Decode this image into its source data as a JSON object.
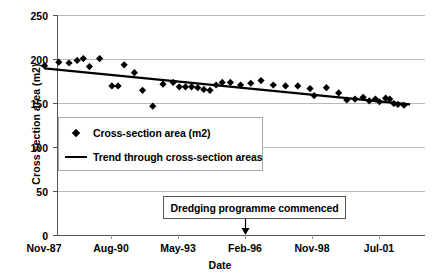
{
  "chart_data": {
    "type": "scatter",
    "title": "",
    "xlabel": "Date",
    "ylabel": "Cross section area (m2)",
    "ylim": [
      0,
      250
    ],
    "yticks": [
      0,
      50,
      100,
      150,
      200,
      250
    ],
    "xticks": [
      "Nov-87",
      "Aug-90",
      "May-93",
      "Feb-96",
      "Nov-98",
      "Jul-01"
    ],
    "grid": true,
    "legend_position": "inside-left",
    "legend": [
      {
        "label": "Cross-section area (m2)",
        "marker": "diamond"
      },
      {
        "label": "Trend through cross-section areas",
        "marker": "line"
      }
    ],
    "annotations": [
      {
        "text": "Dredging programme commenced",
        "points_to_x": "Feb-96"
      }
    ],
    "series": [
      {
        "name": "Cross-section area (m2)",
        "marker": "diamond",
        "color": "#000000",
        "points": [
          {
            "x": "Nov-87",
            "y": 193
          },
          {
            "x": "Jun-88",
            "y": 197
          },
          {
            "x": "Nov-88",
            "y": 196
          },
          {
            "x": "Mar-89",
            "y": 199
          },
          {
            "x": "Jun-89",
            "y": 201
          },
          {
            "x": "Sep-89",
            "y": 192
          },
          {
            "x": "Feb-90",
            "y": 201
          },
          {
            "x": "Aug-90",
            "y": 170
          },
          {
            "x": "Nov-90",
            "y": 170
          },
          {
            "x": "Feb-91",
            "y": 194
          },
          {
            "x": "Jul-91",
            "y": 185
          },
          {
            "x": "Nov-91",
            "y": 165
          },
          {
            "x": "Apr-92",
            "y": 147
          },
          {
            "x": "Sep-92",
            "y": 172
          },
          {
            "x": "Feb-93",
            "y": 174
          },
          {
            "x": "May-93",
            "y": 169
          },
          {
            "x": "Aug-93",
            "y": 169
          },
          {
            "x": "Nov-93",
            "y": 169
          },
          {
            "x": "Feb-94",
            "y": 168
          },
          {
            "x": "May-94",
            "y": 166
          },
          {
            "x": "Aug-94",
            "y": 165
          },
          {
            "x": "Nov-94",
            "y": 171
          },
          {
            "x": "Feb-95",
            "y": 174
          },
          {
            "x": "Jun-95",
            "y": 174
          },
          {
            "x": "Nov-95",
            "y": 171
          },
          {
            "x": "Apr-96",
            "y": 173
          },
          {
            "x": "Sep-96",
            "y": 176
          },
          {
            "x": "Mar-97",
            "y": 171
          },
          {
            "x": "Sep-97",
            "y": 170
          },
          {
            "x": "Mar-98",
            "y": 170
          },
          {
            "x": "Sep-98",
            "y": 167
          },
          {
            "x": "Nov-98",
            "y": 159
          },
          {
            "x": "May-99",
            "y": 168
          },
          {
            "x": "Nov-99",
            "y": 162
          },
          {
            "x": "Mar-00",
            "y": 154
          },
          {
            "x": "Jul-00",
            "y": 155
          },
          {
            "x": "Nov-00",
            "y": 157
          },
          {
            "x": "Feb-01",
            "y": 153
          },
          {
            "x": "May-01",
            "y": 155
          },
          {
            "x": "Jul-01",
            "y": 152
          },
          {
            "x": "Oct-01",
            "y": 156
          },
          {
            "x": "Dec-01",
            "y": 155
          },
          {
            "x": "Feb-02",
            "y": 150
          },
          {
            "x": "Apr-02",
            "y": 149
          },
          {
            "x": "Jul-02",
            "y": 148
          }
        ]
      },
      {
        "name": "Trend through cross-section areas",
        "marker": "line",
        "color": "#000000",
        "start": {
          "x": "Nov-87",
          "y": 190
        },
        "end": {
          "x": "Oct-02",
          "y": 149
        }
      }
    ]
  }
}
